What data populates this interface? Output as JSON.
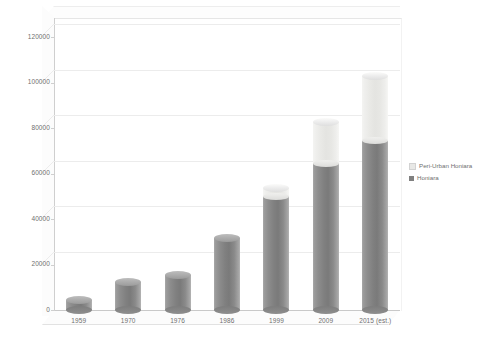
{
  "chart_data": {
    "type": "bar",
    "subtype": "stacked-cylinder-3d",
    "title": "",
    "xlabel": "",
    "ylabel": "",
    "categories": [
      "1959",
      "1970",
      "1976",
      "1986",
      "1999",
      "2009",
      "2015 (est.)"
    ],
    "series": [
      {
        "name": "Honiara",
        "color": "#808080",
        "values": [
          4500,
          12500,
          15500,
          31600,
          50100,
          64600,
          74500
        ]
      },
      {
        "name": "Peri-Urban Honiara",
        "color": "#e8e8e6",
        "values": [
          0,
          0,
          0,
          0,
          3500,
          18000,
          28500
        ]
      }
    ],
    "totals": [
      4500,
      12500,
      15500,
      31600,
      53600,
      82600,
      103000
    ],
    "ylim": [
      0,
      120000
    ],
    "ytick_step": 20000,
    "yticks": [
      "0",
      "20000",
      "40000",
      "60000",
      "80000",
      "100000",
      "120000"
    ],
    "ytick_values": [
      0,
      20000,
      40000,
      60000,
      80000,
      100000,
      120000
    ],
    "grid": true,
    "legend_position": "right",
    "legend_entries": [
      {
        "label": "Peri-Urban Honiara",
        "color": "#e8e8e6"
      },
      {
        "label": "Honiara",
        "color": "#808080"
      }
    ],
    "background": "#ffffff"
  }
}
